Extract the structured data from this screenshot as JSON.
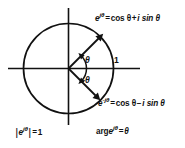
{
  "figure": {
    "name": "euler-formula-unit-circle",
    "background_color": "#ffffff",
    "stroke_color": "#111111",
    "geometry": {
      "center_x": 68,
      "center_y": 68,
      "radius": 45,
      "x_axis_start": 8,
      "x_axis_end": 140,
      "y_axis_top": 8,
      "y_axis_bottom": 125,
      "vector_angle_degrees": 45,
      "vector_angle_negative_degrees": -45
    },
    "labels": {
      "euler_positive": {
        "base": "e",
        "exponent": "jθ",
        "equals": "=",
        "cos_term": "cos θ",
        "operator": "+",
        "sin_term": "i sin θ",
        "full": "e^{jθ} = cos θ + i sin θ"
      },
      "euler_negative": {
        "base": "e",
        "exponent": "-jθ",
        "equals": "=",
        "cos_term": "cos θ",
        "operator": "−",
        "sin_term": "i sin θ",
        "full": "e^{-jθ} = cos θ − i sin θ"
      },
      "modulus": {
        "bar_open": "|",
        "base": "e",
        "exponent": "jθ",
        "bar_close": "|",
        "equals": "=",
        "value": "1",
        "full": "|e^{jθ}| = 1"
      },
      "argument": {
        "prefix": "arg",
        "base": "e",
        "exponent": "jθ",
        "equals": "=",
        "value": "θ",
        "full": "arg e^{jθ} = θ"
      },
      "angle_positive": "θ",
      "angle_negative": "−θ",
      "real_axis_tick": "1"
    }
  }
}
